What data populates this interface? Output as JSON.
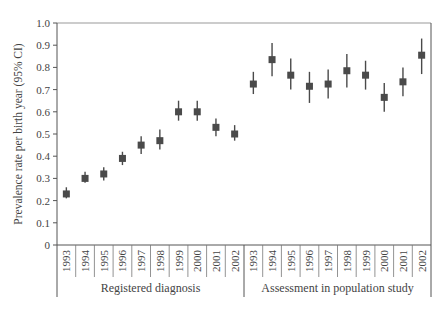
{
  "chart_data": {
    "type": "scatter",
    "subtype": "point-with-error-bars",
    "title": "",
    "xlabel": "",
    "ylabel": "Prevalence rate per birth year  (95% CI)",
    "ylim": [
      0,
      1.0
    ],
    "yticks": [
      "0",
      "0.1",
      "0.2",
      "0.3",
      "0.4",
      "0.5",
      "0.6",
      "0.7",
      "0.8",
      "0.9",
      "1.0"
    ],
    "grid": false,
    "legend": null,
    "groups": [
      {
        "name": "Registered diagnosis",
        "categories": [
          "1993",
          "1994",
          "1995",
          "1996",
          "1997",
          "1998",
          "1999",
          "2000",
          "2001",
          "2002"
        ],
        "values": [
          0.23,
          0.3,
          0.32,
          0.39,
          0.45,
          0.47,
          0.6,
          0.6,
          0.53,
          0.5
        ],
        "ci_low": [
          0.21,
          0.28,
          0.29,
          0.36,
          0.41,
          0.43,
          0.56,
          0.56,
          0.49,
          0.47
        ],
        "ci_high": [
          0.26,
          0.33,
          0.35,
          0.42,
          0.49,
          0.52,
          0.65,
          0.65,
          0.57,
          0.54
        ]
      },
      {
        "name": "Assessment in population study",
        "categories": [
          "1993",
          "1994",
          "1995",
          "1996",
          "1997",
          "1998",
          "1999",
          "2000",
          "2001",
          "2002"
        ],
        "values": [
          0.725,
          0.835,
          0.765,
          0.715,
          0.725,
          0.785,
          0.765,
          0.665,
          0.735,
          0.855
        ],
        "ci_low": [
          0.68,
          0.76,
          0.7,
          0.64,
          0.66,
          0.71,
          0.7,
          0.6,
          0.67,
          0.77
        ],
        "ci_high": [
          0.78,
          0.91,
          0.84,
          0.78,
          0.79,
          0.86,
          0.83,
          0.73,
          0.8,
          0.93
        ]
      }
    ],
    "colors": {
      "marker": "#4a4a4a",
      "axis": "#555555",
      "text": "#444444"
    }
  }
}
